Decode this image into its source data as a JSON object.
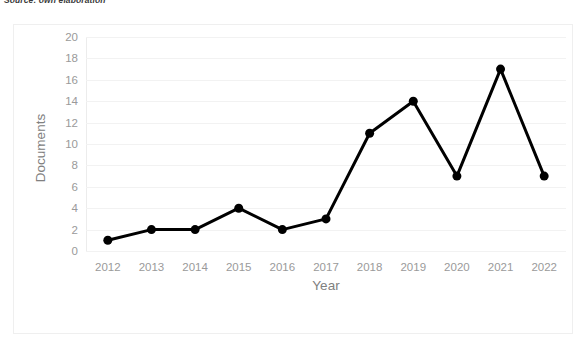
{
  "caption": "Source: own elaboration",
  "chart_data": {
    "type": "line",
    "title": "",
    "xlabel": "Year",
    "ylabel": "Documents",
    "categories": [
      "2012",
      "2013",
      "2014",
      "2015",
      "2016",
      "2017",
      "2018",
      "2019",
      "2020",
      "2021",
      "2022"
    ],
    "values": [
      1,
      2,
      2,
      4,
      2,
      3,
      11,
      14,
      7,
      17,
      7
    ],
    "series": [
      {
        "name": "Documents",
        "values": [
          1,
          2,
          2,
          4,
          2,
          3,
          11,
          14,
          7,
          17,
          7
        ],
        "color": "#000000"
      }
    ],
    "ylim": [
      0,
      20
    ],
    "ytick_step": 2,
    "yticks": [
      0,
      2,
      4,
      6,
      8,
      10,
      12,
      14,
      16,
      18,
      20
    ],
    "grid": true,
    "grid_color": "#f2f2f2",
    "legend": false,
    "legend_position": "none",
    "marker": "circle",
    "line_width": 3,
    "marker_size": 9,
    "axis_label_color": "#808080",
    "tick_label_color": "#9a9a9a"
  }
}
